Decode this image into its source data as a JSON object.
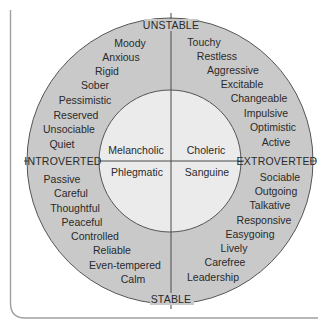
{
  "diagram": {
    "axes": {
      "top": "UNSTABLE",
      "bottom": "STABLE",
      "left": "INTROVERTED",
      "right": "EXTROVERTED"
    },
    "temperaments": {
      "top_left": "Melancholic",
      "top_right": "Choleric",
      "bottom_left": "Phlegmatic",
      "bottom_right": "Sanguine"
    },
    "traits": {
      "unstable_introverted": [
        "Moody",
        "Anxious",
        "Rigid",
        "Sober",
        "Pessimistic",
        "Reserved",
        "Unsociable",
        "Quiet"
      ],
      "unstable_extroverted": [
        "Touchy",
        "Restless",
        "Aggressive",
        "Excitable",
        "Changeable",
        "Impulsive",
        "Optimistic",
        "Active"
      ],
      "stable_introverted": [
        "Passive",
        "Careful",
        "Thoughtful",
        "Peaceful",
        "Controlled",
        "Reliable",
        "Even-tempered",
        "Calm"
      ],
      "stable_extroverted": [
        "Sociable",
        "Outgoing",
        "Talkative",
        "Responsive",
        "Easygoing",
        "Lively",
        "Carefree",
        "Leadership"
      ]
    },
    "colors": {
      "outer_ring": "#c9c9c9",
      "inner_circle": "#ebebeb",
      "lines": "#4a4a4a",
      "frame": "#9a9a9a",
      "text": "#2a2a2a"
    }
  }
}
